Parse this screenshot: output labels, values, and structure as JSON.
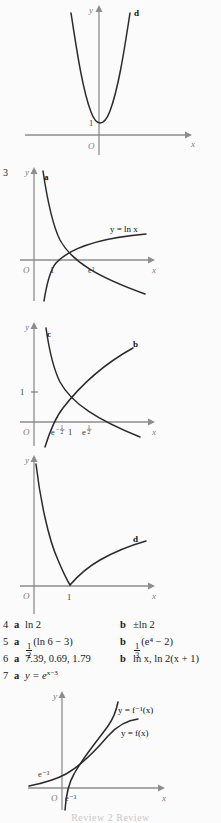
{
  "page": {
    "background_color": "#fbfbfb",
    "axis_color": "#8d8d8d",
    "curve_color": "#2a2a2a",
    "footer_text": "Review 2   Review"
  },
  "figures": [
    {
      "id": "fig-parabola-d",
      "question_number": "",
      "curve_labels": [
        "d"
      ],
      "axis_x_label": "x",
      "axis_y_label": "y",
      "origin_label": "O",
      "y_ticks": [
        "1"
      ],
      "x_ticks": [],
      "equation_labels": []
    },
    {
      "id": "fig-lnx-a",
      "question_number": "3",
      "curve_labels": [
        "a"
      ],
      "axis_x_label": "x",
      "axis_y_label": "y",
      "origin_label": "O",
      "y_ticks": [],
      "x_ticks": [
        "1",
        "e²"
      ],
      "equation_labels": [
        "y = ln x"
      ]
    },
    {
      "id": "fig-bc",
      "question_number": "",
      "curve_labels": [
        "c",
        "b"
      ],
      "axis_x_label": "x",
      "axis_y_label": "y",
      "origin_label": "O",
      "y_ticks": [
        "1"
      ],
      "x_ticks": [
        "e^-1/2",
        "1",
        "e^1/2"
      ],
      "equation_labels": []
    },
    {
      "id": "fig-d2",
      "question_number": "",
      "curve_labels": [
        "d"
      ],
      "axis_x_label": "x",
      "axis_y_label": "y",
      "origin_label": "O",
      "y_ticks": [],
      "x_ticks": [
        "1"
      ],
      "equation_labels": []
    },
    {
      "id": "fig-inverse",
      "question_number": "",
      "curve_labels": [],
      "axis_x_label": "x",
      "axis_y_label": "y",
      "origin_label": "O",
      "y_ticks": [
        "e⁻³"
      ],
      "x_ticks": [
        "e⁻³"
      ],
      "equation_labels": [
        "y = f⁻¹(x)",
        "y = f(x)"
      ]
    }
  ],
  "labels": {
    "q3": "3",
    "a": "a",
    "b": "b",
    "c": "c",
    "d": "d",
    "x": "x",
    "y": "y",
    "O": "O",
    "one": "1",
    "e_sq": "e²",
    "e_neg3": "e⁻³",
    "y_eq_lnx": "y = ln x",
    "y_eq_finv": "y = f⁻¹(x)",
    "y_eq_f": "y = f(x)",
    "tick_e_neg_half_base": "e",
    "tick_e_pos_half_base": "e",
    "tick_one": "1"
  },
  "answers": [
    {
      "number": "4",
      "part_a_label": "a",
      "part_a_value": "ln 2",
      "part_b_label": "b",
      "part_b_value": "±ln 2"
    },
    {
      "number": "5",
      "part_a_label": "a",
      "part_a_value": "(ln 6 − 3)",
      "part_a_fraction": {
        "numerator": "1",
        "denominator": "2"
      },
      "part_b_label": "b",
      "part_b_value": "(e⁴ − 2)",
      "part_b_fraction": {
        "numerator": "1",
        "denominator": "3"
      }
    },
    {
      "number": "6",
      "part_a_label": "a",
      "part_a_value": "7.39, 0.69, 1.79",
      "part_b_label": "b",
      "part_b_value": "ln x, ln 2(x + 1)"
    },
    {
      "number": "7",
      "part_a_label": "a",
      "part_a_value": "y = e",
      "part_a_exponent": "x−3",
      "part_b_label": "",
      "part_b_value": ""
    }
  ]
}
